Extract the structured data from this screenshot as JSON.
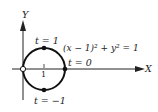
{
  "diagram": {
    "axes": {
      "x_label": "X",
      "y_label": "Y"
    },
    "curve": {
      "equation": "(x − 1)² + y² = 1",
      "type": "circle",
      "center": [
        1,
        0
      ],
      "radius": 1
    },
    "ticks": {
      "x_tick": "1",
      "y_tick": "1"
    },
    "points": [
      {
        "label": "t = 1",
        "position": "top",
        "filled": true
      },
      {
        "label": "t = 0",
        "position": "right",
        "filled": true
      },
      {
        "label": "t = −1",
        "position": "bottom",
        "filled": true
      },
      {
        "label": "",
        "position": "origin",
        "filled": false
      }
    ]
  }
}
